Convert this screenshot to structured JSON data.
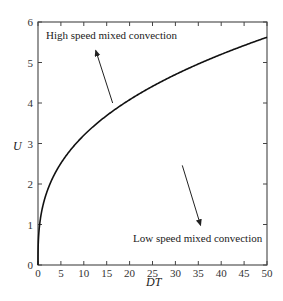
{
  "chart_data": {
    "type": "line",
    "title": "",
    "xlabel": "DT",
    "ylabel": "U",
    "xlim": [
      0,
      50
    ],
    "ylim": [
      0,
      6
    ],
    "xticks": [
      0,
      5,
      10,
      15,
      20,
      25,
      30,
      35,
      40,
      45,
      50
    ],
    "yticks": [
      0,
      1,
      2,
      3,
      4,
      5,
      6
    ],
    "grid": false,
    "legend": null,
    "series": [
      {
        "name": "U vs DT",
        "x": [
          0,
          0.2,
          0.5,
          1,
          2,
          3,
          5,
          7.5,
          10,
          15,
          20,
          25,
          30,
          35,
          40,
          45,
          50
        ],
        "y": [
          0,
          0.8,
          1.1,
          1.43,
          1.82,
          2.1,
          2.5,
          2.89,
          3.2,
          3.69,
          4.08,
          4.4,
          4.68,
          4.94,
          5.17,
          5.39,
          5.6
        ]
      }
    ],
    "annotations": [
      {
        "text": "High speed mixed convection",
        "arrow_from": [
          16.3,
          4.0
        ],
        "arrow_to": [
          12.6,
          5.3
        ]
      },
      {
        "text": "Low speed mixed convection",
        "arrow_from": [
          31.5,
          2.46
        ],
        "arrow_to": [
          35.5,
          0.98
        ]
      }
    ]
  },
  "labels": {
    "xlabel": "DT",
    "ylabel": "U",
    "high": "High speed mixed convection",
    "low": "Low speed mixed convection"
  }
}
